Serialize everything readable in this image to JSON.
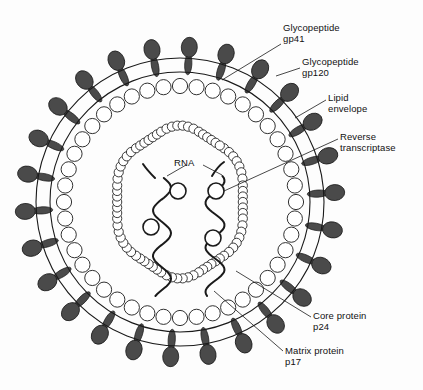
{
  "figure": {
    "background_color": "#fdfdfd",
    "ink_color": "#1a1a1a",
    "protein_fill": "#4a4a4a"
  },
  "labels": {
    "gp41": "Glycopeptide\ngp41",
    "gp120": "Glycopeptide\ngp120",
    "lipid_envelope": "Lipid\nenvelope",
    "reverse_transcriptase": "Reverse\ntranscriptase",
    "rna": "RNA",
    "core_protein": "Core protein\np24",
    "matrix_protein": "Matrix protein\np17"
  },
  "structure": {
    "center": {
      "x": 180,
      "y": 202
    },
    "envelope_outer_radius": 144,
    "envelope_inner_radius": 130,
    "matrix_ring_radius": 116,
    "matrix_bead_radius": 7.6,
    "matrix_bead_count": 44,
    "capsid_bead_radius": 4.6,
    "spike_count": 26,
    "spike_head_rx": 10,
    "spike_head_ry": 8,
    "rna_strand_count": 2,
    "enzyme_circle_count": 4
  },
  "chart_data": {
    "type": "diagram",
    "annotations": [
      {
        "name": "gp41",
        "text": "Glycopeptide gp41",
        "target": "envelope spike stalk"
      },
      {
        "name": "gp120",
        "text": "Glycopeptide gp120",
        "target": "spike head"
      },
      {
        "name": "lipid-envelope",
        "text": "Lipid envelope",
        "target": "outer bilayer"
      },
      {
        "name": "reverse-transcriptase",
        "text": "Reverse transcriptase",
        "target": "enzyme circle on RNA"
      },
      {
        "name": "rna",
        "text": "RNA",
        "target": "wavy genome strands"
      },
      {
        "name": "core-protein",
        "text": "Core protein p24",
        "target": "capsid bead ring"
      },
      {
        "name": "matrix-protein",
        "text": "Matrix protein p17",
        "target": "matrix bead ring"
      }
    ]
  }
}
